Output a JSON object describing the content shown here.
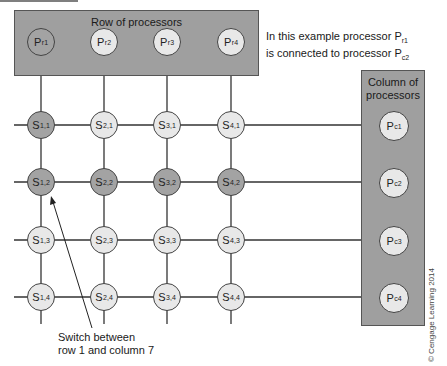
{
  "diagram": {
    "type": "crossbar-switch",
    "row_box": {
      "title": "Row of processors"
    },
    "column_box": {
      "title_line1": "Column of",
      "title_line2": "processors"
    },
    "row_processors": [
      {
        "base": "P",
        "sub": "r1",
        "highlighted": true
      },
      {
        "base": "P",
        "sub": "r2",
        "highlighted": false
      },
      {
        "base": "P",
        "sub": "r3",
        "highlighted": false
      },
      {
        "base": "P",
        "sub": "r4",
        "highlighted": false
      }
    ],
    "column_processors": [
      {
        "base": "P",
        "sub": "c1",
        "highlighted": false
      },
      {
        "base": "P",
        "sub": "c2",
        "highlighted": false
      },
      {
        "base": "P",
        "sub": "c3",
        "highlighted": false
      },
      {
        "base": "P",
        "sub": "c4",
        "highlighted": false
      }
    ],
    "switches": [
      [
        {
          "base": "S",
          "sub": "1,1",
          "dark": true
        },
        {
          "base": "S",
          "sub": "2,1",
          "dark": false
        },
        {
          "base": "S",
          "sub": "3,1",
          "dark": false
        },
        {
          "base": "S",
          "sub": "4,1",
          "dark": false
        }
      ],
      [
        {
          "base": "S",
          "sub": "1,2",
          "dark": true
        },
        {
          "base": "S",
          "sub": "2,2",
          "dark": true
        },
        {
          "base": "S",
          "sub": "3,2",
          "dark": true
        },
        {
          "base": "S",
          "sub": "4,2",
          "dark": true
        }
      ],
      [
        {
          "base": "S",
          "sub": "1,3",
          "dark": false
        },
        {
          "base": "S",
          "sub": "2,3",
          "dark": false
        },
        {
          "base": "S",
          "sub": "3,3",
          "dark": false
        },
        {
          "base": "S",
          "sub": "4,3",
          "dark": false
        }
      ],
      [
        {
          "base": "S",
          "sub": "1,4",
          "dark": false
        },
        {
          "base": "S",
          "sub": "2,4",
          "dark": false
        },
        {
          "base": "S",
          "sub": "3,4",
          "dark": false
        },
        {
          "base": "S",
          "sub": "4,4",
          "dark": false
        }
      ]
    ],
    "example_note": {
      "line1_prefix": "In this example processor P",
      "line1_sub": "r1",
      "line2_prefix": "is connected to processor P",
      "line2_sub": "c2"
    },
    "switch_callout": {
      "line1": "Switch between",
      "line2": "row 1 and column 7"
    },
    "copyright": "© Cengage Learning 2014",
    "colors": {
      "box_fill": "#9f9f9f",
      "node_light": "#e8e8e8",
      "node_dark": "#a3a3a3",
      "line": "#333333"
    }
  }
}
